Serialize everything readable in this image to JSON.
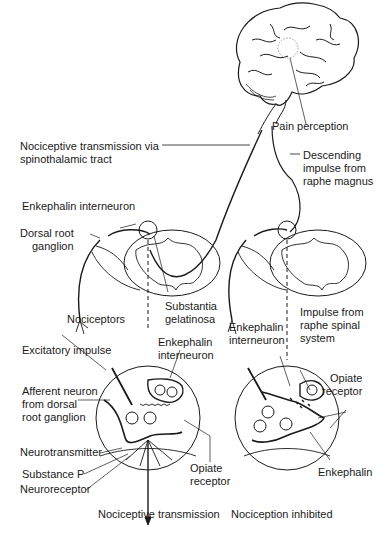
{
  "diagram": {
    "colors": {
      "line": "#1a1a1a",
      "background": "#ffffff",
      "dashed": "#333333"
    },
    "labels": {
      "pain_perception": "Pain perception",
      "nociceptive_tract": [
        "Nociceptive transmission via",
        "spinothalamic tract"
      ],
      "descending_impulse": [
        "Descending",
        "impulse from",
        "raphe magnus"
      ],
      "enkephalin_interneuron_top": "Enkephalin interneuron",
      "dorsal_root_ganglion": [
        "Dorsal root",
        "ganglion"
      ],
      "nociceptors": "Nociceptors",
      "substantia_gelatinosa": [
        "Substantia",
        "gelatinosa"
      ],
      "excitatory_impulse": "Excitatory impulse",
      "enkephalin_interneuron_left": [
        "Enkephalin",
        "interneuron"
      ],
      "afferent_neuron": [
        "Afferent neuron",
        "from dorsal",
        "root ganglion"
      ],
      "neurotransmitter": "Neurotransmitter",
      "substance_p": "Substance P",
      "neuroreceptor": "Neuroreceptor",
      "opiate_receptor_left": [
        "Opiate",
        "receptor"
      ],
      "nociceptive_transmission": "Nociceptive transmission",
      "enkephalin_interneuron_right": [
        "Enkephalin",
        "interneuron"
      ],
      "impulse_raphe_spinal": [
        "Impulse from",
        "raphe spinal",
        "system"
      ],
      "opiate_receptor_right": [
        "Opiate",
        "receptor"
      ],
      "enkephalin": "Enkephalin",
      "nociception_inhibited": "Nociception inhibited"
    },
    "panels": [
      {
        "name": "left",
        "caption_key": "nociceptive_transmission"
      },
      {
        "name": "right",
        "caption_key": "nociception_inhibited"
      }
    ]
  }
}
